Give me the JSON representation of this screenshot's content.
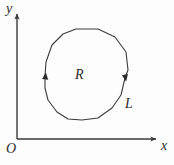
{
  "figure": {
    "type": "math-diagram",
    "background_color": "#fdfdfd",
    "ink_color": "#3a3a3a",
    "label_color": "#2b2b2b"
  },
  "axes": {
    "origin_label": "O",
    "x_axis_label": "x",
    "y_axis_label": "y",
    "origin_point": [
      17,
      139
    ],
    "x_axis_end": [
      159,
      139
    ],
    "y_axis_end": [
      17,
      11
    ],
    "stroke_width": 1.4,
    "arrowheads": true
  },
  "curve": {
    "name_label": "L",
    "region_label": "R",
    "closed": true,
    "orientation": "counterclockwise",
    "stroke_width": 1.1,
    "vertices": [
      [
        76,
        29
      ],
      [
        98,
        29
      ],
      [
        115,
        37
      ],
      [
        126,
        52
      ],
      [
        128,
        70
      ],
      [
        125,
        78
      ],
      [
        121,
        95
      ],
      [
        112,
        108
      ],
      [
        98,
        118
      ],
      [
        82,
        120
      ],
      [
        68,
        119
      ],
      [
        57,
        112
      ],
      [
        48,
        100
      ],
      [
        45,
        88
      ],
      [
        45,
        76
      ],
      [
        46,
        62
      ],
      [
        52,
        45
      ],
      [
        63,
        34
      ]
    ],
    "direction_markers": [
      {
        "name": "left-orientation-arrow",
        "position": [
          45.5,
          76
        ],
        "direction": "down",
        "angle_deg": 186
      },
      {
        "name": "right-orientation-arrow",
        "position": [
          125.5,
          78
        ],
        "direction": "up",
        "angle_deg": 350
      }
    ]
  }
}
